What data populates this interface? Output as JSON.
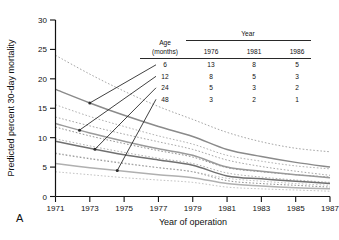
{
  "panel": {
    "label": "A"
  },
  "chart_data": {
    "type": "line",
    "title": "",
    "xlabel": "Year of operation",
    "ylabel": "Predicted percent 30-day mortality",
    "xlim": [
      1971,
      1987
    ],
    "ylim": [
      0,
      30
    ],
    "xticks": [
      1971,
      1973,
      1975,
      1977,
      1979,
      1981,
      1983,
      1985,
      1987
    ],
    "yticks": [
      0,
      5,
      10,
      15,
      20,
      25,
      30
    ],
    "grid": false,
    "legend_position": "inline-labels",
    "x": [
      1971,
      1973,
      1975,
      1977,
      1979,
      1981,
      1983,
      1985,
      1987
    ],
    "series": [
      {
        "name": "6",
        "label": "6",
        "style": "solid",
        "color": "#8a8a8a",
        "values": [
          18.2,
          15.9,
          13.8,
          11.9,
          10.2,
          8.0,
          6.8,
          5.8,
          5.0
        ],
        "ci_upper": [
          24.0,
          20.8,
          17.9,
          15.3,
          13.1,
          10.9,
          9.3,
          8.2,
          7.6
        ],
        "ci_lower": [
          13.5,
          12.0,
          10.6,
          9.3,
          8.0,
          6.2,
          5.1,
          4.3,
          3.6
        ]
      },
      {
        "name": "12",
        "label": "12",
        "style": "solid",
        "color": "#9a9a9a",
        "values": [
          12.4,
          10.8,
          9.4,
          8.1,
          7.0,
          5.0,
          4.3,
          3.7,
          3.2
        ],
        "ci_upper": [
          15.6,
          13.6,
          11.9,
          10.3,
          8.9,
          7.0,
          6.0,
          5.2,
          4.7
        ],
        "ci_lower": [
          9.8,
          8.6,
          7.5,
          6.5,
          5.6,
          4.0,
          3.3,
          2.8,
          2.4
        ]
      },
      {
        "name": "24",
        "label": "24",
        "style": "solid",
        "color": "#707070",
        "values": [
          9.4,
          8.2,
          7.1,
          6.2,
          5.3,
          3.5,
          3.0,
          2.6,
          2.2
        ],
        "ci_upper": [
          11.8,
          10.3,
          9.0,
          7.8,
          6.7,
          4.9,
          4.2,
          3.7,
          3.3
        ],
        "ci_lower": [
          7.3,
          6.4,
          5.6,
          4.9,
          4.2,
          2.7,
          2.2,
          1.9,
          1.6
        ]
      },
      {
        "name": "48",
        "label": "48",
        "style": "solid",
        "color": "#b0b0b0",
        "values": [
          5.6,
          4.9,
          4.3,
          3.7,
          3.2,
          2.2,
          1.8,
          1.5,
          1.3
        ],
        "ci_upper": [
          7.4,
          6.5,
          5.7,
          4.9,
          4.2,
          3.1,
          2.6,
          2.2,
          1.9
        ],
        "ci_lower": [
          4.2,
          3.7,
          3.2,
          2.8,
          2.4,
          1.6,
          1.3,
          1.1,
          0.9
        ]
      }
    ],
    "inline_table": {
      "row_header": "Age",
      "row_header_sub": "(months)",
      "col_group_header": "Year",
      "columns": [
        "1976",
        "1981",
        "1986"
      ],
      "rows": [
        {
          "age": "6",
          "values": [
            "13",
            "8",
            "5"
          ]
        },
        {
          "age": "12",
          "values": [
            "8",
            "5",
            "3"
          ]
        },
        {
          "age": "24",
          "values": [
            "5",
            "3",
            "2"
          ]
        },
        {
          "age": "48",
          "values": [
            "3",
            "2",
            "1"
          ]
        }
      ]
    }
  }
}
